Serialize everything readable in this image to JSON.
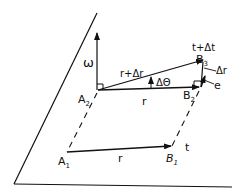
{
  "diagram": {
    "labels": {
      "omega": "ω",
      "A1": "A",
      "A1_sub": "1",
      "A2": "A",
      "A2_sub": "2",
      "B1": "B",
      "B1_sub": "1",
      "B2": "B",
      "B2_sub": "2",
      "B3": "B",
      "B3_sub": "3",
      "r_bottom": "r",
      "r_top": "r",
      "r_plus_dr": "r+Δr",
      "d_theta": "ΔΘ",
      "dr": "Δr",
      "e": "e",
      "t": "t",
      "t_plus_dt": "t+Δt"
    },
    "colors": {
      "ink": "#111111",
      "background": "#ffffff"
    }
  }
}
